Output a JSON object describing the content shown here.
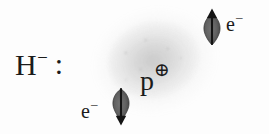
{
  "figure": {
    "background_color": "#fdfdfd",
    "ink_color": "#1b1b1b",
    "cloud_color": "#8c8c8c"
  },
  "labels": {
    "hydride": {
      "symbol": "H",
      "charge": "–",
      "lone_pair": ":"
    },
    "proton": {
      "symbol": "p",
      "charge": "⊕"
    },
    "electron_top": {
      "symbol": "e",
      "charge": "–"
    },
    "electron_bottom": {
      "symbol": "e",
      "charge": "–"
    }
  },
  "spins": [
    {
      "name": "spin-up-arrow",
      "direction": "up",
      "label": "↑"
    },
    {
      "name": "spin-down-arrow",
      "direction": "down",
      "label": "↓"
    }
  ]
}
